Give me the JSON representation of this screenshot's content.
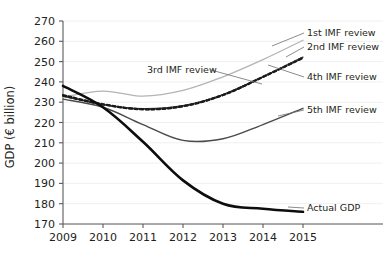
{
  "chart_data": {
    "type": "line",
    "title": "",
    "xlabel": "",
    "ylabel": "GDP (€ billion)",
    "categories": [
      "2009",
      "2010",
      "2011",
      "2012",
      "2013",
      "2014",
      "2015"
    ],
    "x": [
      2009,
      2010,
      2011,
      2012,
      2013,
      2014,
      2015
    ],
    "xlim": [
      2009,
      2015
    ],
    "ylim": [
      170,
      270
    ],
    "ytick_step": 10,
    "yticks": [
      170,
      180,
      190,
      200,
      210,
      220,
      230,
      240,
      250,
      260,
      270
    ],
    "grid": true,
    "legend_position": "inline-annotations",
    "series": [
      {
        "name": "1st IMF review",
        "label": "1st IMF review",
        "style": "solid-light-gray",
        "color": "#b4b4b4",
        "width": 1.3,
        "values": [
          232.5,
          235.5,
          233.0,
          235.8,
          242.5,
          251.0,
          260.5
        ]
      },
      {
        "name": "2nd IMF review",
        "label": "2nd IMF review",
        "style": "dashed-black",
        "color": "#1a1a1a",
        "width": 2.2,
        "values": [
          233.5,
          229.0,
          226.5,
          228.0,
          233.5,
          242.5,
          252.0
        ]
      },
      {
        "name": "3rd IMF review",
        "label": "3rd IMF review",
        "style": "solid-dark-gray",
        "color": "#3c3c3c",
        "width": 1.3,
        "values": [
          233.0,
          228.8,
          226.8,
          228.3,
          233.8,
          242.6,
          252.2
        ]
      },
      {
        "name": "4th IMF review",
        "label": "4th IMF review",
        "style": "dashed-black",
        "color": "#1a1a1a",
        "width": 2.0,
        "values": [
          233.2,
          228.9,
          226.6,
          228.1,
          233.6,
          242.4,
          251.8
        ]
      },
      {
        "name": "5th IMF review",
        "label": "5th IMF review",
        "style": "solid-gray",
        "color": "#4a4a4a",
        "width": 1.4,
        "values": [
          231.5,
          227.5,
          219.0,
          211.2,
          212.0,
          219.0,
          227.0
        ]
      },
      {
        "name": "Actual GDP",
        "label": "Actual GDP",
        "style": "solid-black-thick",
        "color": "#0d0d0d",
        "width": 2.6,
        "values": [
          238.0,
          227.5,
          210.5,
          191.5,
          180.0,
          177.5,
          176.0
        ]
      }
    ],
    "annotations": [
      {
        "name": "1st IMF review",
        "text": "1st IMF review",
        "x": 307,
        "y": 36,
        "anchor": "start"
      },
      {
        "name": "2nd IMF review",
        "text": "2nd IMF review",
        "x": 307,
        "y": 50,
        "anchor": "start"
      },
      {
        "name": "3rd IMF review",
        "text": "3rd IMF review",
        "x": 147,
        "y": 73,
        "anchor": "start"
      },
      {
        "name": "4th IMF review",
        "text": "4th IMF review",
        "x": 307,
        "y": 80,
        "anchor": "start"
      },
      {
        "name": "5th IMF review",
        "text": "5th IMF review",
        "x": 307,
        "y": 113,
        "anchor": "start"
      },
      {
        "name": "Actual GDP",
        "text": "Actual GDP",
        "x": 307,
        "y": 211,
        "anchor": "start"
      }
    ]
  },
  "axis": {
    "y_title": "GDP (€ billion)",
    "y_labels": [
      "270",
      "260",
      "250",
      "240",
      "230",
      "220",
      "210",
      "200",
      "190",
      "180",
      "170"
    ],
    "x_labels": [
      "2009",
      "2010",
      "2011",
      "2012",
      "2013",
      "2014",
      "2015"
    ]
  },
  "colors": {
    "axis": "#5a5a5a",
    "grid": "#f0f0f0",
    "text": "#231f20",
    "actual_gdp": "#0d0d0d",
    "first_review": "#b4b4b4",
    "fifth_review": "#4a4a4a",
    "background": "#ffffff"
  }
}
